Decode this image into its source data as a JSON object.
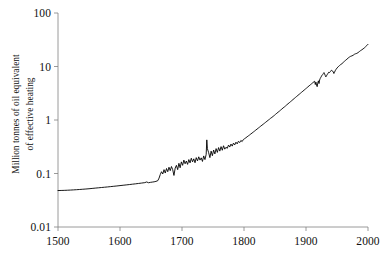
{
  "chart_data": {
    "type": "line",
    "title": "",
    "subtitle": "",
    "xlabel": "",
    "ylabel": "Million tonnes of oil equivalent of effective heating",
    "ylabel_lines": [
      "Million tonnes of oil equivalent",
      "of effective heating"
    ],
    "yscale": "log",
    "xscale": "linear",
    "xlim": [
      1500,
      2000
    ],
    "ylim": [
      0.01,
      100
    ],
    "grid": false,
    "legend": null,
    "annotations": [],
    "xticks": [
      1500,
      1600,
      1700,
      1800,
      1900,
      2000
    ],
    "xtick_labels": [
      "1500",
      "1600",
      "1700",
      "1800",
      "1900",
      "2000"
    ],
    "yticks": [
      0.01,
      0.1,
      1,
      10,
      100
    ],
    "ytick_labels": [
      "0.01",
      "0.1",
      "1",
      "10",
      "100"
    ],
    "line_color": "#000000",
    "line_width": 0.9,
    "series": [
      {
        "name": "Effective heating energy",
        "x": [
          1500,
          1505,
          1510,
          1515,
          1520,
          1525,
          1530,
          1535,
          1540,
          1545,
          1550,
          1555,
          1560,
          1565,
          1570,
          1575,
          1580,
          1585,
          1590,
          1595,
          1600,
          1605,
          1610,
          1615,
          1620,
          1625,
          1630,
          1635,
          1640,
          1643,
          1646,
          1649,
          1652,
          1655,
          1658,
          1661,
          1663,
          1665,
          1667,
          1669,
          1671,
          1673,
          1675,
          1677,
          1679,
          1681,
          1683,
          1685,
          1687,
          1689,
          1691,
          1693,
          1695,
          1697,
          1699,
          1701,
          1703,
          1705,
          1707,
          1709,
          1711,
          1713,
          1715,
          1717,
          1719,
          1721,
          1723,
          1725,
          1727,
          1729,
          1731,
          1733,
          1735,
          1737,
          1739,
          1740,
          1741,
          1743,
          1745,
          1747,
          1749,
          1751,
          1753,
          1755,
          1757,
          1759,
          1761,
          1763,
          1765,
          1767,
          1769,
          1771,
          1773,
          1775,
          1777,
          1779,
          1781,
          1783,
          1785,
          1787,
          1789,
          1791,
          1793,
          1795,
          1797,
          1799,
          1801,
          1803,
          1805,
          1807,
          1809,
          1811,
          1813,
          1815,
          1817,
          1819,
          1821,
          1823,
          1825,
          1827,
          1829,
          1831,
          1833,
          1835,
          1837,
          1839,
          1841,
          1843,
          1845,
          1847,
          1849,
          1851,
          1853,
          1855,
          1857,
          1859,
          1861,
          1863,
          1865,
          1867,
          1869,
          1871,
          1873,
          1875,
          1877,
          1879,
          1881,
          1883,
          1885,
          1887,
          1889,
          1891,
          1893,
          1895,
          1897,
          1899,
          1901,
          1903,
          1905,
          1907,
          1909,
          1911,
          1913,
          1914,
          1915,
          1916,
          1917,
          1918,
          1919,
          1920,
          1921,
          1922,
          1923,
          1924,
          1925,
          1926,
          1927,
          1928,
          1929,
          1930,
          1931,
          1932,
          1933,
          1934,
          1935,
          1936,
          1937,
          1938,
          1939,
          1940,
          1941,
          1942,
          1943,
          1944,
          1945,
          1946,
          1947,
          1948,
          1949,
          1950,
          1952,
          1954,
          1956,
          1958,
          1960,
          1962,
          1964,
          1966,
          1968,
          1970,
          1972,
          1974,
          1976,
          1978,
          1980,
          1982,
          1984,
          1986,
          1988,
          1990,
          1992,
          1994,
          1996,
          1998,
          2000
        ],
        "y": [
          0.048,
          0.0482,
          0.0484,
          0.0487,
          0.049,
          0.0494,
          0.0498,
          0.0503,
          0.0508,
          0.0513,
          0.0519,
          0.0526,
          0.0533,
          0.054,
          0.0547,
          0.0554,
          0.0561,
          0.0569,
          0.0577,
          0.0585,
          0.0594,
          0.0603,
          0.0612,
          0.0621,
          0.0631,
          0.0641,
          0.0652,
          0.0663,
          0.0675,
          0.0695,
          0.0672,
          0.0683,
          0.0691,
          0.0699,
          0.0712,
          0.0735,
          0.082,
          0.096,
          0.108,
          0.098,
          0.118,
          0.102,
          0.124,
          0.108,
          0.131,
          0.113,
          0.135,
          0.118,
          0.092,
          0.126,
          0.142,
          0.118,
          0.155,
          0.128,
          0.165,
          0.142,
          0.178,
          0.152,
          0.171,
          0.148,
          0.182,
          0.158,
          0.193,
          0.165,
          0.188,
          0.159,
          0.198,
          0.172,
          0.205,
          0.178,
          0.196,
          0.168,
          0.213,
          0.182,
          0.228,
          0.425,
          0.29,
          0.245,
          0.198,
          0.262,
          0.215,
          0.275,
          0.232,
          0.292,
          0.248,
          0.305,
          0.262,
          0.318,
          0.272,
          0.33,
          0.285,
          0.31,
          0.295,
          0.34,
          0.312,
          0.355,
          0.325,
          0.37,
          0.342,
          0.385,
          0.358,
          0.4,
          0.378,
          0.415,
          0.395,
          0.432,
          0.448,
          0.465,
          0.485,
          0.505,
          0.525,
          0.548,
          0.57,
          0.595,
          0.62,
          0.648,
          0.675,
          0.705,
          0.735,
          0.768,
          0.8,
          0.835,
          0.87,
          0.908,
          0.948,
          0.99,
          1.03,
          1.08,
          1.12,
          1.17,
          1.22,
          1.28,
          1.34,
          1.4,
          1.46,
          1.53,
          1.6,
          1.68,
          1.75,
          1.83,
          1.92,
          2.01,
          2.1,
          2.2,
          2.3,
          2.41,
          2.52,
          2.64,
          2.76,
          2.89,
          3.02,
          3.16,
          3.31,
          3.46,
          3.62,
          3.79,
          3.96,
          4.15,
          4.35,
          4.55,
          4.76,
          4.98,
          5.2,
          5.3,
          4.6,
          5.1,
          4.5,
          4.2,
          4.9,
          5.4,
          4.8,
          5.6,
          6.0,
          6.3,
          6.6,
          6.9,
          7.1,
          7.4,
          7.7,
          7.3,
          6.8,
          6.4,
          6.7,
          7.0,
          7.3,
          7.6,
          7.9,
          7.7,
          8.0,
          8.2,
          8.5,
          8.4,
          8.2,
          7.9,
          7.4,
          7.8,
          8.3,
          8.7,
          9.0,
          9.4,
          9.9,
          10.4,
          10.9,
          11.3,
          11.9,
          12.5,
          13.1,
          13.7,
          14.4,
          15.0,
          15.5,
          15.8,
          16.2,
          16.9,
          17.3,
          17.6,
          18.2,
          19.0,
          19.8,
          20.5,
          21.3,
          22.2,
          23.4,
          24.6,
          26.0
        ]
      }
    ]
  },
  "plot_geometry": {
    "left_px": 58,
    "right_px": 368,
    "top_px": 13,
    "bottom_px": 227
  }
}
